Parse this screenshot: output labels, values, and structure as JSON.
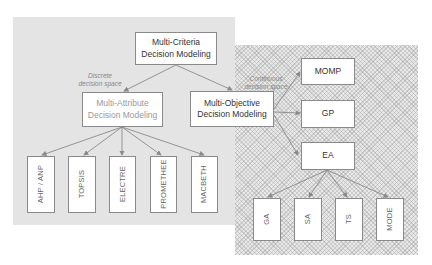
{
  "diagram": {
    "root": {
      "line1": "Multi-Criteria",
      "line2": "Decision Modeling"
    },
    "branches": {
      "discrete": {
        "label_line1": "Discrete",
        "label_line2": "decision space",
        "node": {
          "line1": "Multi-Attribute",
          "line2": "Decision Modeling"
        },
        "methods": [
          "AHP / ANP",
          "TOPSIS",
          "ELECTRE",
          "PROMETHEE",
          "MACBETH"
        ]
      },
      "continuous": {
        "label_line1": "Continuous",
        "label_line2": "decision space",
        "node": {
          "line1": "Multi-Objective",
          "line2": "Decision Modeling"
        },
        "methods": [
          "MOMP",
          "GP",
          "EA"
        ],
        "ea_children": [
          "GA",
          "SA",
          "TS",
          "MODE"
        ]
      }
    },
    "colors": {
      "gray_panel": "#e4e4e4",
      "hatch_panel": "#e8e8e8",
      "box_border": "#8a8a8a",
      "arrow": "#8a8a8a"
    }
  }
}
